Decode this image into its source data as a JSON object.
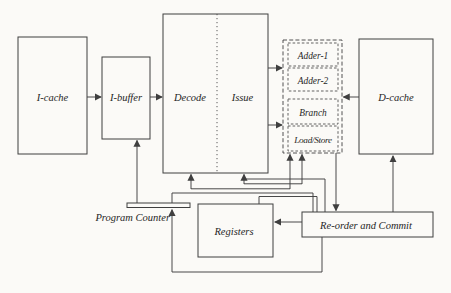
{
  "figure": {
    "type": "processor-pipeline-block-diagram",
    "colors": {
      "background": "#fbfaf7",
      "line": "#3f3f3f",
      "text": "#262626"
    },
    "blocks": {
      "i_cache": "I-cache",
      "i_buffer": "I-buffer",
      "decode": "Decode",
      "issue": "Issue",
      "adder_1": "Adder-1",
      "adder_2": "Adder-2",
      "branch": "Branch",
      "load_store": "Load/Store",
      "d_cache": "D-cache",
      "program_counter": "Program Counter",
      "registers": "Registers",
      "reorder_commit": "Re-order and Commit"
    }
  }
}
